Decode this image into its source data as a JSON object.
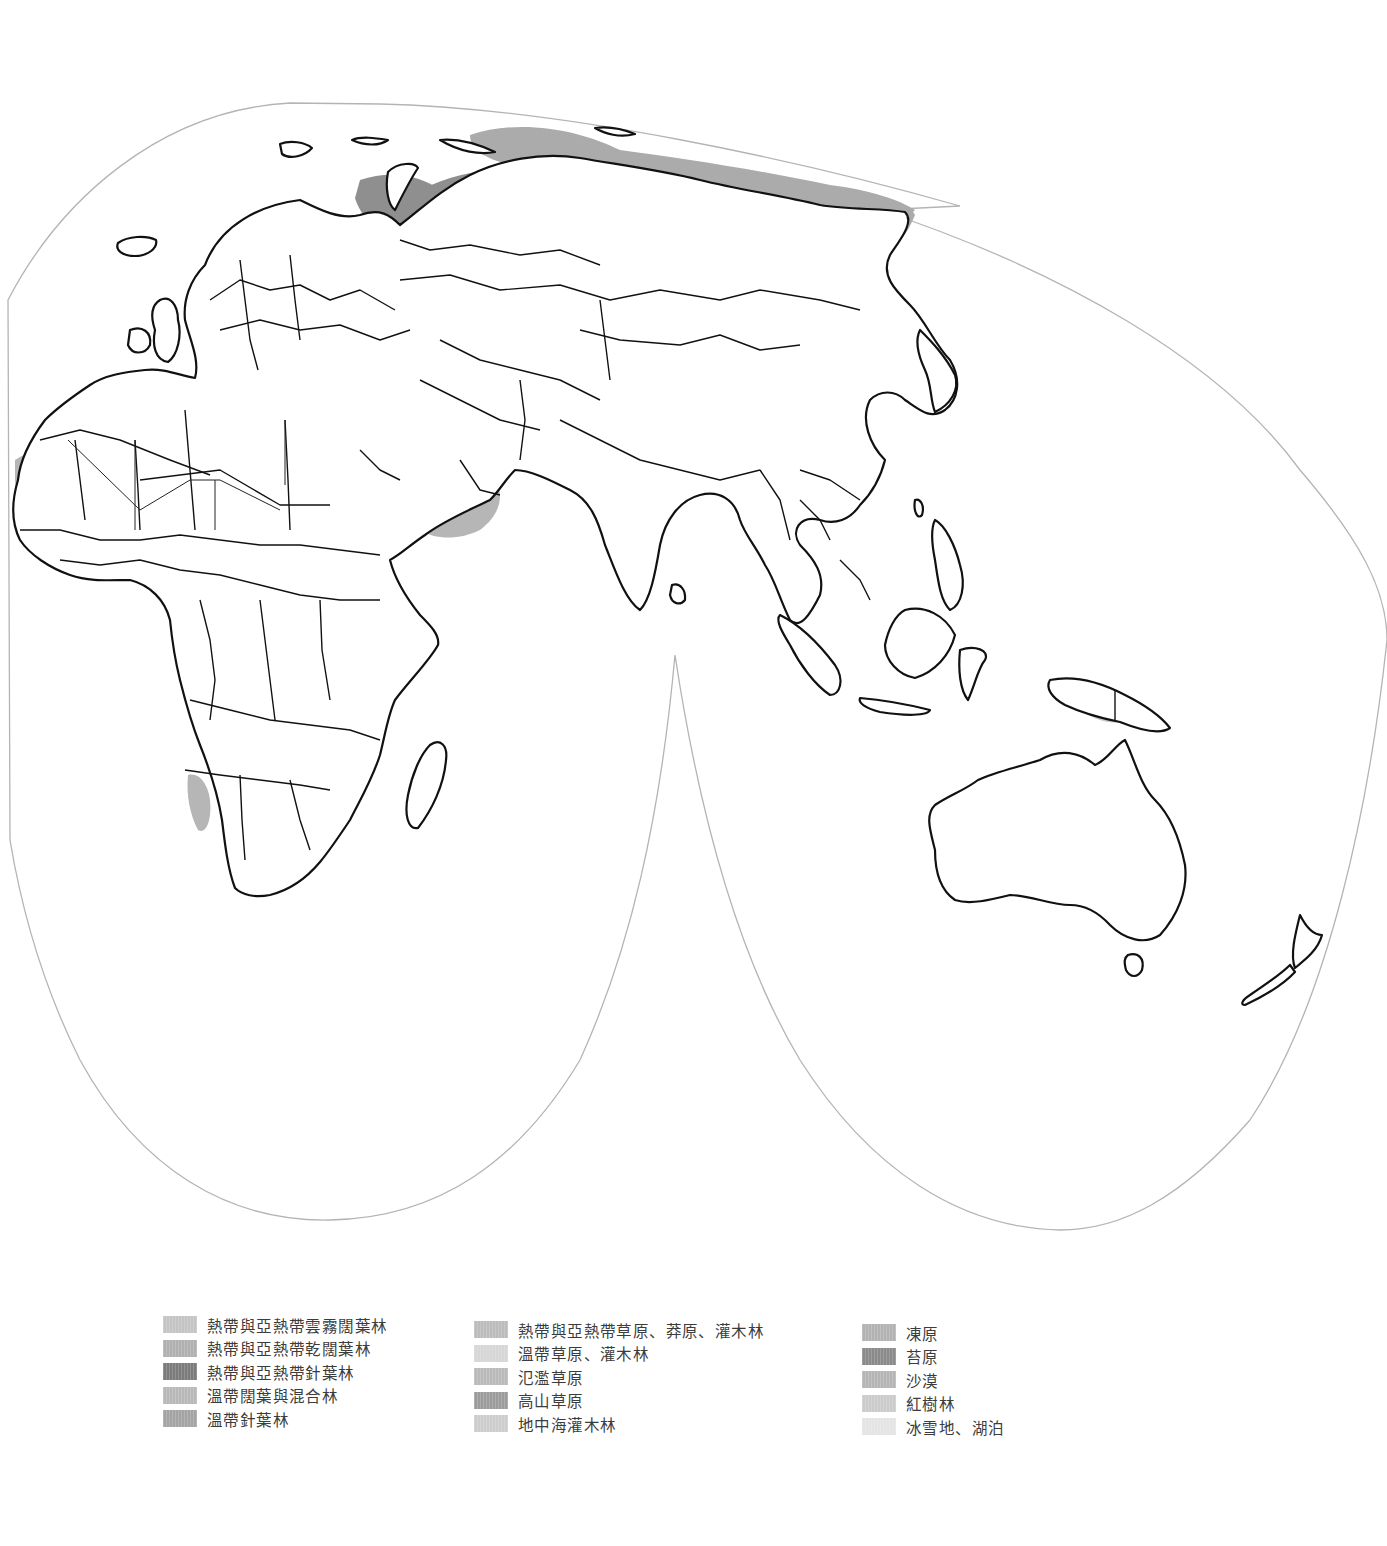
{
  "map": {
    "projection": "interrupted-goode-homolosine-eastern-hemisphere",
    "outline_color": "#b4b4b4",
    "coastline_color": "#111111",
    "regions_shown": [
      "Europe",
      "Africa",
      "Asia",
      "Australia",
      "New Zealand",
      "Southeast Asia"
    ]
  },
  "legend": {
    "columns": [
      {
        "items": [
          {
            "label": "熱帶與亞熱帶雲霧闊葉林",
            "color": "#c4c4c4",
            "icon": "swatch-tropical-moist-broadleaf"
          },
          {
            "label": "熱帶與亞熱帶乾闊葉林",
            "color": "#b0b0b0",
            "icon": "swatch-tropical-dry-broadleaf"
          },
          {
            "label": "熱帶與亞熱帶針葉林",
            "color": "#7b7b7b",
            "icon": "swatch-tropical-conifer"
          },
          {
            "label": "溫帶闊葉與混合林",
            "color": "#b8b8b8",
            "icon": "swatch-temperate-broadleaf-mixed"
          },
          {
            "label": "溫帶針葉林",
            "color": "#a4a4a4",
            "icon": "swatch-temperate-conifer"
          }
        ]
      },
      {
        "items": [
          {
            "label": "熱帶與亞熱帶草原、莽原、灌木林",
            "color": "#bcbcbc",
            "icon": "swatch-tropical-grassland-savanna"
          },
          {
            "label": "溫帶草原、灌木林",
            "color": "#d6d6d6",
            "icon": "swatch-temperate-grassland"
          },
          {
            "label": "氾濫草原",
            "color": "#bababa",
            "icon": "swatch-flooded-grassland"
          },
          {
            "label": "高山草原",
            "color": "#9c9c9c",
            "icon": "swatch-montane-grassland"
          },
          {
            "label": "地中海灌木林",
            "color": "#cdcdcd",
            "icon": "swatch-mediterranean-scrub"
          }
        ]
      },
      {
        "items": [
          {
            "label": "凍原",
            "color": "#b2b2b2",
            "icon": "swatch-tundra"
          },
          {
            "label": "苔原",
            "color": "#8a8a8a",
            "icon": "swatch-moss-tundra"
          },
          {
            "label": "沙漠",
            "color": "#b5b5b5",
            "icon": "swatch-desert"
          },
          {
            "label": "紅樹林",
            "color": "#cbcbcb",
            "icon": "swatch-mangrove"
          },
          {
            "label": "冰雪地、湖泊",
            "color": "#e4e4e4",
            "icon": "swatch-ice-lakes"
          }
        ]
      }
    ]
  }
}
